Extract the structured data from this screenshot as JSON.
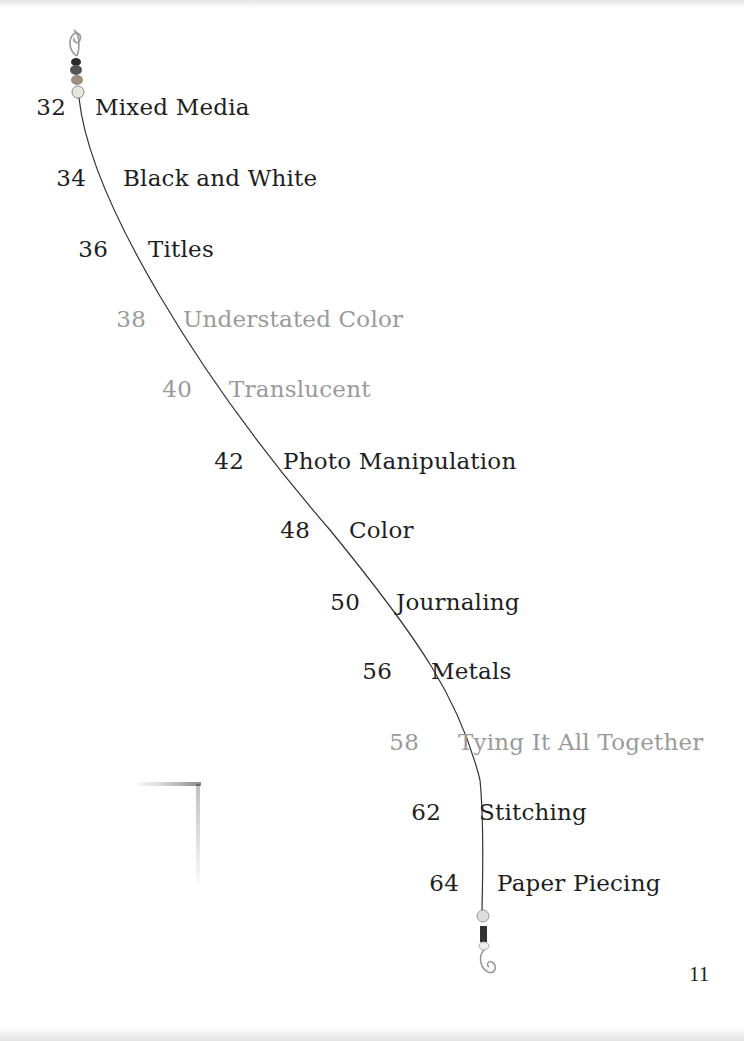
{
  "toc": {
    "entries": [
      {
        "page": "32",
        "title": "Mixed Media",
        "tone": "dark"
      },
      {
        "page": "34",
        "title": "Black and White",
        "tone": "dark"
      },
      {
        "page": "36",
        "title": "Titles",
        "tone": "dark"
      },
      {
        "page": "38",
        "title": "Understated Color",
        "tone": "gray"
      },
      {
        "page": "40",
        "title": "Translucent",
        "tone": "gray"
      },
      {
        "page": "42",
        "title": "Photo Manipulation",
        "tone": "dark"
      },
      {
        "page": "48",
        "title": "Color",
        "tone": "dark"
      },
      {
        "page": "50",
        "title": "Journaling",
        "tone": "dark"
      },
      {
        "page": "56",
        "title": "Metals",
        "tone": "dark"
      },
      {
        "page": "58",
        "title": "Tying It All Together",
        "tone": "gray"
      },
      {
        "page": "62",
        "title": "Stitching",
        "tone": "dark"
      },
      {
        "page": "64",
        "title": "Paper Piecing",
        "tone": "dark"
      }
    ]
  },
  "folio": "11",
  "colors": {
    "dark_text": "#1e1e1e",
    "gray_text": "#9a9a9a",
    "wire": "#333333"
  }
}
